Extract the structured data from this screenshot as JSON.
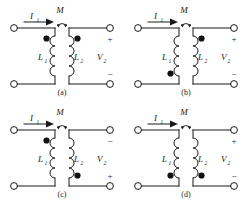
{
  "figure": {
    "type": "circuit-diagram",
    "panel_count": 4,
    "colors": {
      "line": "#1a1a1a",
      "dot": "#111111",
      "background": "#ffffff"
    }
  },
  "labels": {
    "mutual": "M",
    "current": "I",
    "current_sub": "1",
    "inductor1": "L",
    "inductor1_sub": "1",
    "inductor2": "L",
    "inductor2_sub": "2",
    "voltage": "V",
    "voltage_sub": "2",
    "plus": "+",
    "minus": "−"
  },
  "panels": [
    {
      "id": "a",
      "caption": "(a)",
      "current_label": "I",
      "current_sub": "1",
      "mutual_label": "M",
      "left_coil_label": "L",
      "left_coil_sub": "1",
      "right_coil_label": "L",
      "right_coil_sub": "2",
      "voltage_label": "V",
      "voltage_sub": "2",
      "dot_left": "top",
      "dot_right": "top",
      "polarity_top": "+",
      "polarity_bottom": "−"
    },
    {
      "id": "b",
      "caption": "(b)",
      "current_label": "I",
      "current_sub": "1",
      "mutual_label": "M",
      "left_coil_label": "L",
      "left_coil_sub": "1",
      "right_coil_label": "L",
      "right_coil_sub": "2",
      "voltage_label": "V",
      "voltage_sub": "2",
      "dot_left": "bottom",
      "dot_right": "top",
      "polarity_top": "+",
      "polarity_bottom": "−"
    },
    {
      "id": "c",
      "caption": "(c)",
      "current_label": "I",
      "current_sub": "1",
      "mutual_label": "M",
      "left_coil_label": "L",
      "left_coil_sub": "1",
      "right_coil_label": "L",
      "right_coil_sub": "2",
      "voltage_label": "V",
      "voltage_sub": "2",
      "dot_left": "top",
      "dot_right": "bottom",
      "polarity_top": "−",
      "polarity_bottom": "+"
    },
    {
      "id": "d",
      "caption": "(d)",
      "current_label": "I",
      "current_sub": "1",
      "mutual_label": "M",
      "left_coil_label": "L",
      "left_coil_sub": "1",
      "right_coil_label": "L",
      "right_coil_sub": "2",
      "voltage_label": "V",
      "voltage_sub": "2",
      "dot_left": "bottom",
      "dot_right": "bottom",
      "polarity_top": "+",
      "polarity_bottom": "−"
    }
  ]
}
